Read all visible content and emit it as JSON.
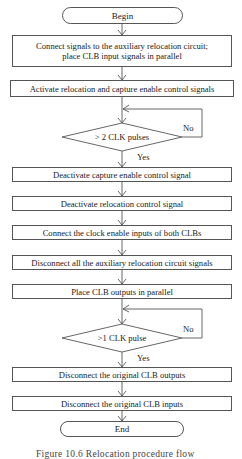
{
  "flowchart": {
    "begin": "Begin",
    "end": "End",
    "steps": [
      {
        "id": "s1",
        "lines": [
          "Connect signals to the auxiliary relocation circuit;",
          "place CLB input signals in parallel"
        ]
      },
      {
        "id": "s2",
        "label": "Activate relocation and capture enable control signals"
      },
      {
        "id": "s3",
        "label": "Deactivate capture enable control signal"
      },
      {
        "id": "s4",
        "label": "Deactivate relocation control signal"
      },
      {
        "id": "s5",
        "label": "Connect the clock enable inputs of both CLBs"
      },
      {
        "id": "s6",
        "label": "Disconnect all the auxiliary relocation circuit signals"
      },
      {
        "id": "s7",
        "label": "Place CLB outputs in parallel"
      },
      {
        "id": "s8",
        "label": "Disconnect the original CLB outputs"
      },
      {
        "id": "s9",
        "label": "Disconnect the original CLB inputs"
      }
    ],
    "decisions": [
      {
        "id": "d1",
        "label": "> 2 CLK pulses",
        "yes": "Yes",
        "no": "No"
      },
      {
        "id": "d2",
        "label": ">1 CLK pulse",
        "yes": "Yes",
        "no": "No"
      }
    ],
    "caption": "Figure 10.6   Relocation procedure flow"
  },
  "colors": {
    "stroke": "#555555",
    "text": "#222222",
    "background": "#ffffff"
  }
}
